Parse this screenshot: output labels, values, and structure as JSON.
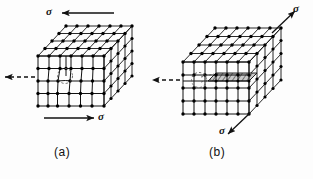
{
  "figure": {
    "type": "materials-science-diagram",
    "background_color": "#fdfdfd",
    "line_color": "#111111",
    "atom_color": "#000000",
    "slip_plane_fill": "#b8b8b8",
    "panels": [
      {
        "id": "a",
        "caption": "(a)",
        "description": "cubic crystal lattice containing an edge dislocation, sheared by opposing stresses",
        "stress_labels": [
          {
            "id": "sigma-a-top",
            "text": "σ",
            "arrow_direction": "left",
            "arrow_style": "solid"
          },
          {
            "id": "sigma-a-bottom",
            "text": "σ",
            "arrow_direction": "right",
            "arrow_style": "solid"
          }
        ],
        "burgers_arrow": {
          "direction": "left",
          "style": "dashed"
        },
        "lattice": {
          "columns": 6,
          "rows": 4,
          "depth": 4
        },
        "dislocation_marker": "dashed-circle"
      },
      {
        "id": "b",
        "caption": "(b)",
        "description": "same crystal after the dislocation has glided, producing a slip step; stresses act along the diagonal",
        "stress_labels": [
          {
            "id": "sigma-b-top",
            "text": "σ",
            "arrow_direction": "up-right",
            "arrow_style": "solid"
          },
          {
            "id": "sigma-b-bottom",
            "text": "σ",
            "arrow_direction": "down-left",
            "arrow_style": "solid"
          }
        ],
        "burgers_arrow": {
          "direction": "left",
          "style": "dashed"
        },
        "lattice": {
          "columns": 6,
          "rows": 4,
          "depth": 5
        },
        "dislocation_marker": "dashed-circle",
        "slip_plane_visible": true
      }
    ]
  }
}
